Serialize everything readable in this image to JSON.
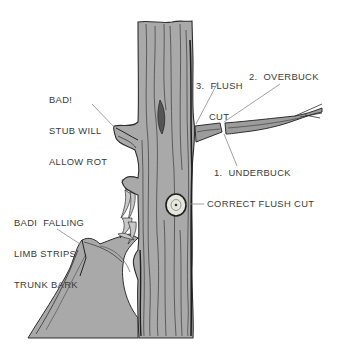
{
  "diagram": {
    "colors": {
      "background": "#ffffff",
      "bark_fill": "#a9a9a9",
      "bark_dark": "#3a3a3a",
      "leader_line": "#8a8a8a",
      "label_text": "#3a3a3a",
      "cut_wound": "#e8e8e0"
    },
    "labels": {
      "stub_warning": {
        "line1": "BAD!",
        "line2": "STUB WILL",
        "line3": "ALLOW ROT"
      },
      "falling_limb_warning": {
        "line1": "BADI  FALLING",
        "line2": "LIMB STRIPS",
        "line3": "TRUNK BARK"
      },
      "step3": {
        "line1": "3.  FLUSH",
        "line2": "CUT"
      },
      "step2": "2.  OVERBUCK",
      "step1": "1.  UNDERBUCK",
      "correct_cut": "CORRECT FLUSH CUT"
    },
    "steps": [
      {
        "number": 1,
        "name": "UNDERBUCK"
      },
      {
        "number": 2,
        "name": "OVERBUCK"
      },
      {
        "number": 3,
        "name": "FLUSH CUT"
      }
    ]
  }
}
